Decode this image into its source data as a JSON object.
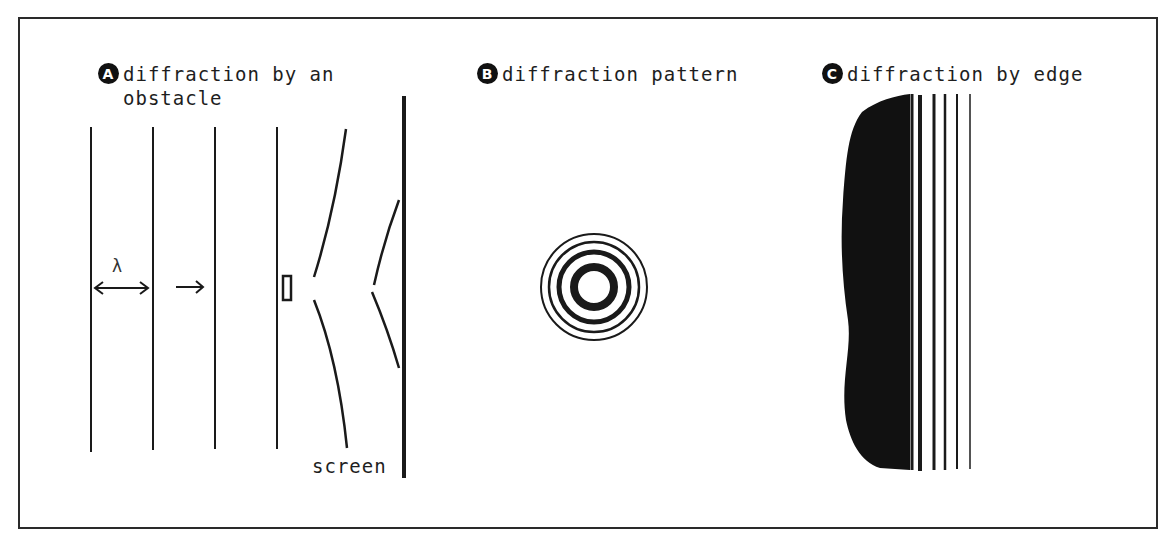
{
  "panels": [
    {
      "badge": "A",
      "title": "diffraction by an\nobstacle",
      "labels": {
        "wavelength": "λ",
        "screen": "screen"
      }
    },
    {
      "badge": "B",
      "title": "diffraction pattern"
    },
    {
      "badge": "C",
      "title": "diffraction by edge"
    }
  ],
  "colors": {
    "ink": "#1a1a1a",
    "background": "#ffffff"
  }
}
